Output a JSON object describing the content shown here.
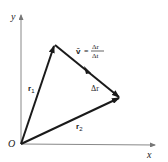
{
  "diagram": {
    "type": "vector-diagram",
    "axes": {
      "x_label": "x",
      "y_label": "y",
      "origin_label": "O"
    },
    "vectors": [
      {
        "name": "r1",
        "label": "r",
        "subscript": "1",
        "from": "O",
        "to": "P1"
      },
      {
        "name": "r2",
        "label": "r",
        "subscript": "2",
        "from": "O",
        "to": "P2"
      },
      {
        "name": "delta_r",
        "label": "Δr",
        "from": "P1",
        "to": "P2"
      }
    ],
    "equation": {
      "lhs": "v̄",
      "equals": "=",
      "numerator": "Δr",
      "denominator": "Δt"
    },
    "colors": {
      "axis": "#888888",
      "vector": "#1a1a1a",
      "text": "#222222"
    }
  }
}
